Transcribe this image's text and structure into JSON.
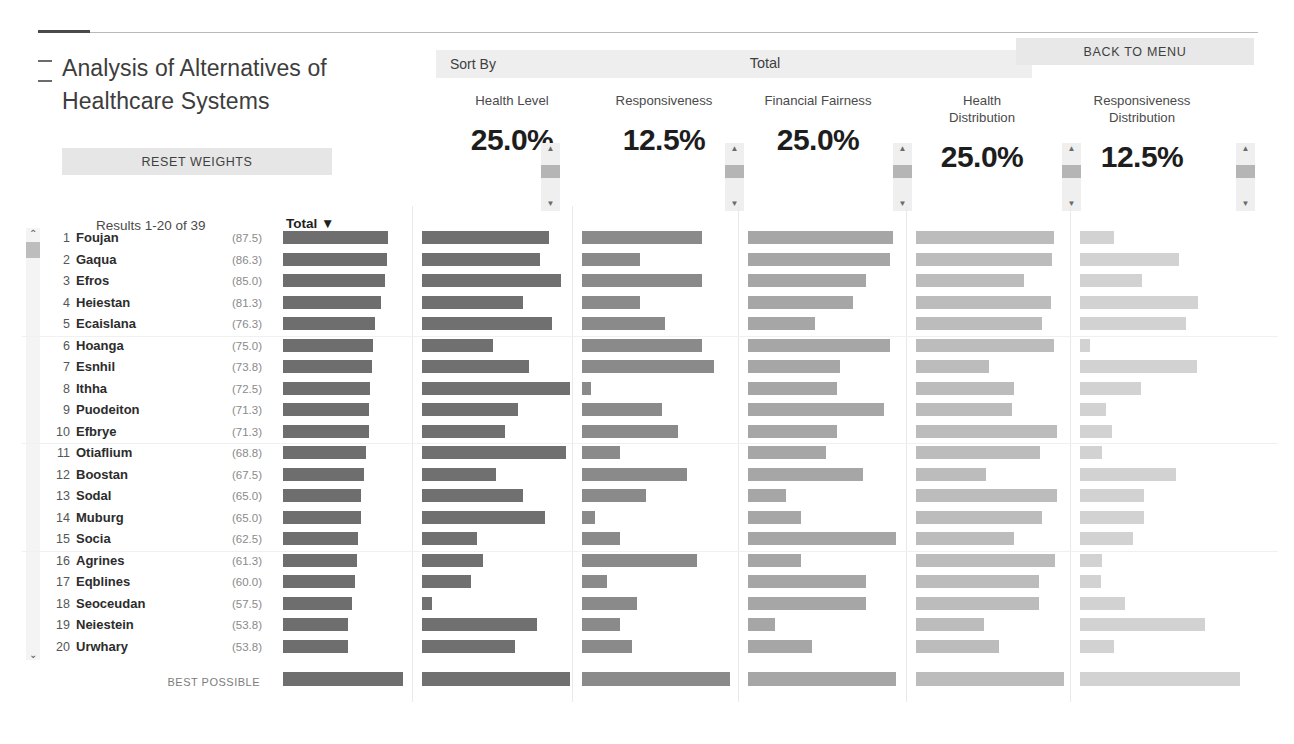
{
  "app": {
    "title": "Analysis of Alternatives of Healthcare Systems",
    "reset_button": "RESET WEIGHTS",
    "back_button": "BACK TO MENU",
    "sort_by_label": "Sort By",
    "sort_by_value": "Total",
    "results_label": "Results 1-20 of 39",
    "total_header": "Total ▼",
    "best_possible_label": "BEST POSSIBLE",
    "chevron_up": "⌃",
    "chevron_down": "⌄",
    "scroll_up_icon": "⌃",
    "scroll_down_icon": "⌄"
  },
  "colors": {
    "total_bar": "#6e6e6e",
    "health_level_bar": "#707070",
    "responsiveness_bar": "#8a8a8a",
    "financial_fairness_bar": "#a6a6a6",
    "health_distribution_bar": "#bcbcbc",
    "responsiveness_distribution_bar": "#d2d2d2",
    "chrome": "#e7e7e7",
    "text": "#3a3a3a"
  },
  "criteria": [
    {
      "name": "Health Level",
      "weight": "25.0%",
      "x": 438,
      "bar_x": 422,
      "bar_max": 148,
      "color": "#707070",
      "spinner_x": 541
    },
    {
      "name": "Responsiveness",
      "weight": "12.5%",
      "x": 590,
      "bar_x": 582,
      "bar_max": 148,
      "color": "#8a8a8a",
      "spinner_x": 725
    },
    {
      "name": "Financial Fairness",
      "weight": "25.0%",
      "x": 744,
      "bar_x": 748,
      "bar_max": 148,
      "color": "#a6a6a6",
      "spinner_x": 893
    },
    {
      "name": "Health\nDistribution",
      "weight": "25.0%",
      "x": 908,
      "bar_x": 916,
      "bar_max": 148,
      "color": "#bcbcbc",
      "spinner_x": 1062
    },
    {
      "name": "Responsiveness\nDistribution",
      "weight": "12.5%",
      "x": 1068,
      "bar_x": 1080,
      "bar_max": 160,
      "color": "#d2d2d2",
      "spinner_x": 1236
    }
  ],
  "chart_data": {
    "type": "bar",
    "title": "Analysis of Alternatives of Healthcare Systems",
    "orientation": "horizontal",
    "sorted_by": "Total",
    "categories": [
      "Foujan",
      "Gaqua",
      "Efros",
      "Heiestan",
      "Ecaislana",
      "Hoanga",
      "Esnhil",
      "Ithha",
      "Puodeiton",
      "Efbrye",
      "Otiaflium",
      "Boostan",
      "Sodal",
      "Muburg",
      "Socia",
      "Agrines",
      "Eqblines",
      "Seoceudan",
      "Neiestein",
      "Urwhary"
    ],
    "ranks": [
      1,
      2,
      3,
      4,
      5,
      6,
      7,
      8,
      9,
      10,
      11,
      12,
      13,
      14,
      15,
      16,
      17,
      18,
      19,
      20
    ],
    "total_scores": [
      "(87.5)",
      "(86.3)",
      "(85.0)",
      "(81.3)",
      "(76.3)",
      "(75.0)",
      "(73.8)",
      "(72.5)",
      "(71.3)",
      "(71.3)",
      "(68.8)",
      "(67.5)",
      "(65.0)",
      "(65.0)",
      "(62.5)",
      "(61.3)",
      "(60.0)",
      "(57.5)",
      "(53.8)",
      "(53.8)"
    ],
    "series": [
      {
        "name": "Total",
        "color": "#6e6e6e",
        "max": 100,
        "values": [
          87.5,
          86.3,
          85.0,
          81.3,
          76.3,
          75.0,
          73.8,
          72.5,
          71.3,
          71.3,
          68.8,
          67.5,
          65.0,
          65.0,
          62.5,
          61.3,
          60.0,
          57.5,
          53.8,
          53.8
        ]
      },
      {
        "name": "Health Level",
        "color": "#707070",
        "max": 100,
        "values": [
          86,
          80,
          94,
          68,
          88,
          48,
          72,
          100,
          65,
          56,
          97,
          50,
          68,
          83,
          37,
          41,
          33,
          7,
          78,
          63
        ]
      },
      {
        "name": "Responsiveness",
        "color": "#8a8a8a",
        "max": 100,
        "values": [
          81,
          39,
          81,
          39,
          56,
          81,
          89,
          6,
          54,
          65,
          26,
          71,
          43,
          9,
          26,
          78,
          17,
          37,
          26,
          34
        ]
      },
      {
        "name": "Financial Fairness",
        "color": "#a6a6a6",
        "max": 100,
        "values": [
          98,
          96,
          80,
          71,
          45,
          96,
          62,
          60,
          92,
          60,
          53,
          78,
          26,
          36,
          100,
          36,
          80,
          80,
          18,
          43
        ]
      },
      {
        "name": "Health Distribution",
        "color": "#bcbcbc",
        "max": 100,
        "values": [
          93,
          92,
          73,
          91,
          85,
          93,
          49,
          66,
          65,
          95,
          84,
          47,
          95,
          85,
          66,
          94,
          83,
          83,
          46,
          56
        ]
      },
      {
        "name": "Responsiveness Distribution",
        "color": "#d2d2d2",
        "max": 100,
        "values": [
          21,
          62,
          39,
          74,
          66,
          6,
          73,
          38,
          16,
          20,
          14,
          60,
          40,
          40,
          33,
          14,
          13,
          28,
          78,
          21
        ]
      }
    ],
    "best_possible": {
      "label": "BEST POSSIBLE",
      "values": [
        100,
        100,
        100,
        100,
        100,
        100
      ]
    }
  }
}
